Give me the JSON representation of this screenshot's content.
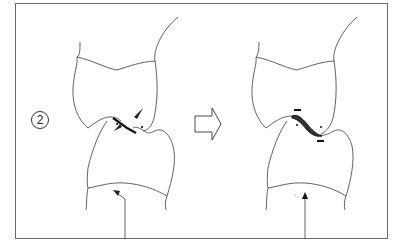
{
  "figure": {
    "step_number": "2",
    "panels": [
      {
        "name": "before",
        "description": "Upper and lower teeth in contact with interference marks (arrowheads and dots) at contact point"
      },
      {
        "name": "after",
        "description": "Teeth after adjustment with shaded contact area and minus marks indicating reduction"
      }
    ],
    "transition_arrow": "hollow-right-arrow",
    "colors": {
      "line": "#3a3a3a",
      "frame": "#6a6a6a",
      "mark": "#222222",
      "background": "#ffffff"
    }
  }
}
